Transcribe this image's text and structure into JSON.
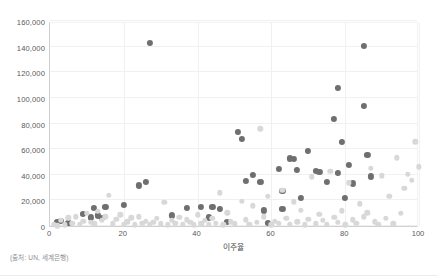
{
  "chart_data": {
    "type": "scatter",
    "title": "",
    "xlabel": "이주율",
    "ylabel": "",
    "xlim": [
      0,
      100
    ],
    "ylim": [
      0,
      160000
    ],
    "grid": true,
    "legend": "none",
    "x_ticks": [
      "0",
      "20",
      "40",
      "60",
      "80",
      "100"
    ],
    "x_tick_values": [
      0,
      20,
      40,
      60,
      80,
      100
    ],
    "y_ticks": [
      "0",
      "20,000",
      "40,000",
      "60,000",
      "80,000",
      "100,000",
      "120,000",
      "140,000",
      "160,000"
    ],
    "y_tick_values": [
      0,
      20000,
      40000,
      60000,
      80000,
      100000,
      120000,
      140000,
      160000
    ],
    "colors": {
      "series_dark": "#6f6f6f",
      "series_light": "#d8d8d8",
      "axis": "#cfcfd4",
      "grid": "#f0f0f2",
      "text": "#58585c",
      "background": "#ffffff"
    },
    "series": [
      {
        "name": "series-dark",
        "color": "#6f6f6f",
        "points": [
          [
            2,
            5500
          ],
          [
            3,
            6000
          ],
          [
            5,
            5000
          ],
          [
            9,
            11500
          ],
          [
            11,
            9000
          ],
          [
            12,
            16500
          ],
          [
            13,
            10500
          ],
          [
            14,
            8500
          ],
          [
            15,
            17000
          ],
          [
            20,
            18500
          ],
          [
            24,
            34000
          ],
          [
            26,
            36500
          ],
          [
            27,
            145000
          ],
          [
            33,
            10500
          ],
          [
            37,
            16500
          ],
          [
            41,
            17000
          ],
          [
            43,
            9000
          ],
          [
            44,
            17000
          ],
          [
            46,
            15500
          ],
          [
            48,
            5500
          ],
          [
            51,
            76000
          ],
          [
            52,
            70000
          ],
          [
            53,
            37500
          ],
          [
            55,
            42000
          ],
          [
            57,
            37000
          ],
          [
            58,
            14500
          ],
          [
            59,
            4500
          ],
          [
            62,
            47000
          ],
          [
            63,
            29500
          ],
          [
            63,
            15500
          ],
          [
            65,
            55000
          ],
          [
            66,
            54500
          ],
          [
            67,
            46000
          ],
          [
            68,
            24000
          ],
          [
            70,
            61000
          ],
          [
            72,
            45500
          ],
          [
            73,
            44500
          ],
          [
            75,
            36500
          ],
          [
            77,
            86000
          ],
          [
            78,
            110000
          ],
          [
            78,
            43500
          ],
          [
            79,
            68000
          ],
          [
            80,
            24500
          ],
          [
            81,
            50000
          ],
          [
            82,
            35500
          ],
          [
            85,
            143000
          ],
          [
            85,
            96000
          ],
          [
            86,
            58000
          ],
          [
            87,
            41000
          ]
        ]
      },
      {
        "name": "series-light",
        "color": "#d8d8d8",
        "points": [
          [
            1,
            3500
          ],
          [
            2,
            2500
          ],
          [
            3,
            6500
          ],
          [
            4,
            3000
          ],
          [
            5,
            8500
          ],
          [
            6,
            4500
          ],
          [
            7,
            9500
          ],
          [
            8,
            3500
          ],
          [
            9,
            6000
          ],
          [
            10,
            12000
          ],
          [
            11,
            5000
          ],
          [
            12,
            4000
          ],
          [
            13,
            13500
          ],
          [
            14,
            6500
          ],
          [
            15,
            9500
          ],
          [
            16,
            26000
          ],
          [
            17,
            4000
          ],
          [
            18,
            7500
          ],
          [
            19,
            11000
          ],
          [
            20,
            3500
          ],
          [
            21,
            5500
          ],
          [
            22,
            8500
          ],
          [
            23,
            3000
          ],
          [
            24,
            9500
          ],
          [
            25,
            4500
          ],
          [
            26,
            6000
          ],
          [
            27,
            3500
          ],
          [
            28,
            5000
          ],
          [
            29,
            8000
          ],
          [
            30,
            4000
          ],
          [
            31,
            20500
          ],
          [
            32,
            3000
          ],
          [
            33,
            6500
          ],
          [
            34,
            4500
          ],
          [
            35,
            9000
          ],
          [
            36,
            3500
          ],
          [
            37,
            7000
          ],
          [
            38,
            5000
          ],
          [
            39,
            3000
          ],
          [
            40,
            11000
          ],
          [
            41,
            4000
          ],
          [
            42,
            6500
          ],
          [
            43,
            3500
          ],
          [
            44,
            8000
          ],
          [
            45,
            4500
          ],
          [
            46,
            28000
          ],
          [
            47,
            3000
          ],
          [
            48,
            12500
          ],
          [
            49,
            5500
          ],
          [
            50,
            4000
          ],
          [
            52,
            21500
          ],
          [
            53,
            7000
          ],
          [
            54,
            3500
          ],
          [
            55,
            18000
          ],
          [
            56,
            5000
          ],
          [
            57,
            78000
          ],
          [
            58,
            9500
          ],
          [
            59,
            25500
          ],
          [
            60,
            3000
          ],
          [
            61,
            6000
          ],
          [
            62,
            4500
          ],
          [
            63,
            30000
          ],
          [
            64,
            8000
          ],
          [
            65,
            3500
          ],
          [
            66,
            21000
          ],
          [
            67,
            5500
          ],
          [
            68,
            14500
          ],
          [
            69,
            3000
          ],
          [
            70,
            7500
          ],
          [
            71,
            40500
          ],
          [
            72,
            4000
          ],
          [
            73,
            11500
          ],
          [
            74,
            6500
          ],
          [
            75,
            3500
          ],
          [
            76,
            45000
          ],
          [
            77,
            9000
          ],
          [
            78,
            5000
          ],
          [
            79,
            14000
          ],
          [
            80,
            3000
          ],
          [
            81,
            36000
          ],
          [
            82,
            7000
          ],
          [
            83,
            4500
          ],
          [
            84,
            19500
          ],
          [
            85,
            9500
          ],
          [
            86,
            12500
          ],
          [
            87,
            47000
          ],
          [
            88,
            5500
          ],
          [
            89,
            3500
          ],
          [
            90,
            41500
          ],
          [
            91,
            8000
          ],
          [
            92,
            25500
          ],
          [
            93,
            4000
          ],
          [
            94,
            55500
          ],
          [
            95,
            12000
          ],
          [
            96,
            31500
          ],
          [
            97,
            42500
          ],
          [
            98,
            38000
          ],
          [
            99,
            68000
          ],
          [
            100,
            48500
          ]
        ]
      }
    ]
  },
  "footer": {
    "source": "(출처: UN, 세계은행)"
  }
}
